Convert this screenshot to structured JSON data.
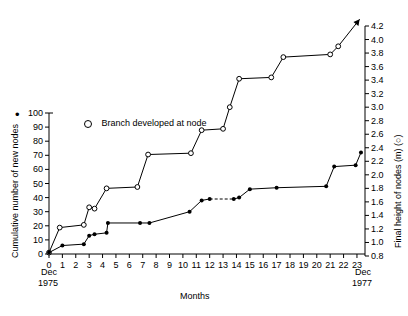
{
  "chart_data": {
    "type": "line",
    "title": "",
    "xlabel": "Months",
    "ylabel": "Cumulative number of new nodes",
    "y2label": "Final height of nodes (m) (○)",
    "xlim": [
      0,
      23.6
    ],
    "ylim": [
      0,
      100
    ],
    "y2lim": [
      0.8,
      4.2
    ],
    "xticks": [
      "0",
      "1",
      "2",
      "3",
      "4",
      "5",
      "6",
      "7",
      "8",
      "9",
      "10",
      "11",
      "12",
      "13",
      "14",
      "15",
      "16",
      "17",
      "18",
      "19",
      "20",
      "21",
      "22",
      "23"
    ],
    "yticks": [
      "0",
      "10",
      "20",
      "30",
      "40",
      "50",
      "60",
      "70",
      "80",
      "90",
      "100"
    ],
    "y2ticks": [
      "0.8",
      "1.0",
      "1.2",
      "1.4",
      "1.6",
      "1.8",
      "2.0",
      "2.2",
      "2.4",
      "2.6",
      "2.8",
      "3.0",
      "3.2",
      "3.4",
      "3.6",
      "3.8",
      "4.0",
      "4.2"
    ],
    "x_start_caption": "Dec\n1975",
    "x_start_caption_line1": "Dec",
    "x_start_caption_line2": "1975",
    "x_end_caption_line1": "Dec",
    "x_end_caption_line2": "1977",
    "grid": false,
    "legend_position": "top-left-inside",
    "legend": [
      {
        "marker": "open-circle",
        "label": "Branch developed at node"
      },
      {
        "marker": "filled-circle",
        "label": ""
      }
    ],
    "marker_key_bullet": "•",
    "series": [
      {
        "name": "Final height of nodes",
        "marker": "open-circle",
        "axis": "right",
        "units": "m",
        "linestyle": "solid",
        "end_arrow": true,
        "points": [
          {
            "x": 0.0,
            "y": 0.85
          },
          {
            "x": 0.8,
            "y": 1.22
          },
          {
            "x": 2.6,
            "y": 1.26
          },
          {
            "x": 3.0,
            "y": 1.52
          },
          {
            "x": 3.4,
            "y": 1.5
          },
          {
            "x": 4.3,
            "y": 1.8
          },
          {
            "x": 6.6,
            "y": 1.82
          },
          {
            "x": 7.4,
            "y": 2.3
          },
          {
            "x": 10.6,
            "y": 2.32
          },
          {
            "x": 11.4,
            "y": 2.66
          },
          {
            "x": 13.0,
            "y": 2.68
          },
          {
            "x": 13.5,
            "y": 3.0
          },
          {
            "x": 14.2,
            "y": 3.42
          },
          {
            "x": 16.6,
            "y": 3.44
          },
          {
            "x": 17.5,
            "y": 3.74
          },
          {
            "x": 21.0,
            "y": 3.78
          },
          {
            "x": 21.6,
            "y": 3.9
          },
          {
            "x": 23.2,
            "y": 4.3
          }
        ]
      },
      {
        "name": "Cumulative number of new nodes",
        "marker": "filled-circle",
        "axis": "left",
        "units": "nodes",
        "linestyle": "solid-with-dashed-gap",
        "points": [
          {
            "x": 0.0,
            "y": 1
          },
          {
            "x": 1.0,
            "y": 6
          },
          {
            "x": 2.6,
            "y": 7
          },
          {
            "x": 3.0,
            "y": 13
          },
          {
            "x": 3.4,
            "y": 14
          },
          {
            "x": 4.3,
            "y": 15
          },
          {
            "x": 4.4,
            "y": 22
          },
          {
            "x": 6.8,
            "y": 22
          },
          {
            "x": 7.5,
            "y": 22
          },
          {
            "x": 10.5,
            "y": 30
          },
          {
            "x": 11.4,
            "y": 38
          },
          {
            "x": 12.0,
            "y": 39
          },
          {
            "x": 13.8,
            "y": 39
          },
          {
            "x": 14.2,
            "y": 40
          },
          {
            "x": 15.0,
            "y": 46
          },
          {
            "x": 17.0,
            "y": 47
          },
          {
            "x": 20.7,
            "y": 48
          },
          {
            "x": 21.3,
            "y": 62
          },
          {
            "x": 22.9,
            "y": 63
          },
          {
            "x": 23.3,
            "y": 72
          }
        ],
        "dashed_segment": {
          "from_x": 12.0,
          "to_x": 13.8
        }
      }
    ]
  }
}
